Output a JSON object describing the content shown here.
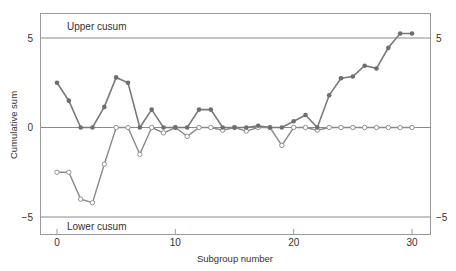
{
  "chart_data": {
    "type": "line",
    "title": "",
    "xlabel": "Subgroup number",
    "ylabel": "Cumulative sum",
    "xlim": [
      -1.5,
      31.5
    ],
    "ylim": [
      -6.0,
      6.3
    ],
    "x_ticks": [
      0,
      10,
      20,
      30
    ],
    "y_ticks_left": [
      5,
      0,
      -5
    ],
    "y_ticks_right": [
      5,
      -5
    ],
    "grid": false,
    "reference_lines": [
      {
        "y": 5,
        "label": "Upper cusum"
      },
      {
        "y": 0,
        "label": ""
      },
      {
        "y": -5,
        "label": "Lower cusum"
      }
    ],
    "x": [
      0,
      1,
      2,
      3,
      4,
      5,
      6,
      7,
      8,
      9,
      10,
      11,
      12,
      13,
      14,
      15,
      16,
      17,
      18,
      19,
      20,
      21,
      22,
      23,
      24,
      25,
      26,
      27,
      28,
      29,
      30
    ],
    "series": [
      {
        "name": "Upper cusum",
        "marker": "filled-circle",
        "values": [
          2.5,
          1.5,
          0,
          0,
          1.15,
          2.8,
          2.5,
          0,
          1.0,
          0,
          0,
          0,
          1.0,
          1.0,
          0,
          0,
          0,
          0.1,
          0,
          0,
          0.35,
          0.7,
          0,
          1.8,
          2.75,
          2.85,
          3.45,
          3.3,
          4.45,
          5.25,
          5.25
        ]
      },
      {
        "name": "Lower cusum",
        "marker": "open-circle",
        "values": [
          -2.5,
          -2.5,
          -4.0,
          -4.2,
          -2.05,
          0,
          0,
          -1.5,
          0,
          -0.3,
          0,
          -0.5,
          0,
          0,
          -0.15,
          0,
          -0.2,
          0,
          0,
          -1.0,
          0,
          0,
          -0.15,
          0,
          0,
          0,
          0,
          0,
          0,
          0,
          0
        ]
      }
    ],
    "colors": {
      "line": "#7a7a7a",
      "frame": "#9a9a9a",
      "filled_marker": "#6e6e6e",
      "open_marker_fill": "#ffffff"
    }
  },
  "labels": {
    "upper": "Upper cusum",
    "lower": "Lower cusum",
    "xlabel": "Subgroup number",
    "ylabel": "Cumulative sum",
    "ytick_5": "5",
    "ytick_0": "0",
    "ytick_m5": "−5",
    "rtick_5": "5",
    "rtick_m5": "−5",
    "xtick_0": "0",
    "xtick_10": "10",
    "xtick_20": "20",
    "xtick_30": "30"
  }
}
